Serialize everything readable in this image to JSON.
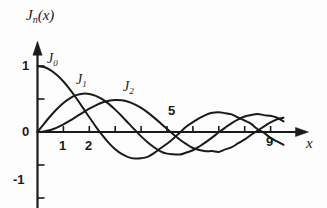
{
  "figure": {
    "background": "#fdfdfd",
    "ink_color": "#1a1a1a",
    "width": 327,
    "height": 208
  },
  "axes": {
    "y_axis_title": "J",
    "y_axis_title_sub": "n",
    "y_axis_title_tail": "(x)",
    "x_axis_title": "x",
    "origin_label": "0",
    "y_tick_labels": [
      "1",
      "0",
      "-1"
    ],
    "x_tick_labels": [
      "1",
      "2",
      "5",
      "9"
    ],
    "x_range": [
      0,
      10
    ],
    "y_range": [
      -1.25,
      1.3
    ],
    "x_ticks_shown": [
      1,
      2,
      3,
      4,
      5,
      6,
      7,
      8,
      9
    ],
    "y_ticks_shown": [
      1,
      0.5,
      -0.5,
      -1
    ]
  },
  "curve_labels": [
    {
      "name": "J0",
      "base": "J",
      "sub": "0",
      "x": 47,
      "y": 52
    },
    {
      "name": "J1",
      "base": "J",
      "sub": "1",
      "x": 76,
      "y": 73
    },
    {
      "name": "J2",
      "base": "J",
      "sub": "2",
      "x": 123,
      "y": 80
    }
  ],
  "chart_data": {
    "type": "line",
    "title": "",
    "xlabel": "x",
    "ylabel": "J_n(x)",
    "xlim": [
      0,
      10
    ],
    "ylim": [
      -1.25,
      1.3
    ],
    "grid": false,
    "legend": "inline-curve-labels",
    "x_tick_values": [
      1,
      2,
      3,
      4,
      5,
      6,
      7,
      8,
      9
    ],
    "x_tick_labels_visible": [
      "1",
      "2",
      "5",
      "9"
    ],
    "y_tick_values": [
      1,
      0.5,
      0,
      -0.5,
      -1
    ],
    "y_tick_labels_visible": [
      "1",
      "0",
      "-1"
    ],
    "x": [
      0,
      0.25,
      0.5,
      0.75,
      1,
      1.25,
      1.5,
      1.75,
      2,
      2.25,
      2.5,
      2.75,
      3,
      3.25,
      3.5,
      3.75,
      4,
      4.25,
      4.5,
      4.75,
      5,
      5.25,
      5.5,
      5.75,
      6,
      6.25,
      6.5,
      6.75,
      7,
      7.25,
      7.5,
      7.75,
      8,
      8.25,
      8.5,
      8.75,
      9,
      9.25,
      9.5
    ],
    "series": [
      {
        "name": "J0",
        "label": "J_0(x)",
        "values": [
          1.0,
          0.9844,
          0.9385,
          0.8642,
          0.7652,
          0.6459,
          0.5118,
          0.369,
          0.2239,
          0.0827,
          -0.0484,
          -0.1641,
          -0.2601,
          -0.3325,
          -0.3801,
          -0.4026,
          -0.3971,
          -0.3766,
          -0.3205,
          -0.2459,
          -0.1776,
          -0.0968,
          -0.0068,
          0.0827,
          0.1506,
          0.2095,
          0.2601,
          0.2921,
          0.3001,
          0.2855,
          0.2663,
          0.2163,
          0.1717,
          0.1222,
          0.0419,
          -0.0142,
          -0.0903,
          -0.1436,
          -0.1939
        ]
      },
      {
        "name": "J1",
        "label": "J_1(x)",
        "values": [
          0.0,
          0.124,
          0.2423,
          0.3492,
          0.4401,
          0.5106,
          0.5579,
          0.5802,
          0.5767,
          0.5484,
          0.4971,
          0.4258,
          0.3391,
          0.2419,
          0.1374,
          0.0353,
          -0.066,
          -0.1538,
          -0.2311,
          -0.2927,
          -0.3276,
          -0.3371,
          -0.3414,
          -0.311,
          -0.2767,
          -0.2196,
          -0.1538,
          -0.0819,
          -0.0047,
          0.067,
          0.1352,
          0.1925,
          0.2346,
          0.2591,
          0.2731,
          0.2556,
          0.2453,
          0.2153,
          0.1613
        ]
      },
      {
        "name": "J2",
        "label": "J_2(x)",
        "values": [
          0.0,
          0.0078,
          0.0306,
          0.0671,
          0.1149,
          0.1711,
          0.2321,
          0.294,
          0.3528,
          0.4048,
          0.4461,
          0.4744,
          0.4861,
          0.4813,
          0.4586,
          0.4194,
          0.3641,
          0.2966,
          0.2178,
          0.1335,
          0.0466,
          -0.0389,
          -0.1173,
          -0.1841,
          -0.2429,
          -0.274,
          -0.2911,
          -0.2891,
          -0.3014,
          -0.2638,
          -0.2301,
          -0.1702,
          -0.113,
          -0.041,
          0.0212,
          0.0862,
          0.1448,
          0.1904,
          0.2173
        ]
      }
    ]
  }
}
